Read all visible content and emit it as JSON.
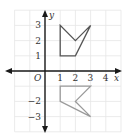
{
  "diagram": {
    "type": "coordinate-plane-reflection",
    "axes": {
      "x_label": "x",
      "y_label": "y",
      "origin_label": "O",
      "x_range": [
        -2,
        5
      ],
      "y_range": [
        -4,
        4
      ],
      "x_ticks": [
        {
          "value": 1,
          "label": "1"
        },
        {
          "value": 2,
          "label": "2"
        },
        {
          "value": 3,
          "label": "3"
        },
        {
          "value": 4,
          "label": "4"
        }
      ],
      "y_ticks": [
        {
          "value": 3,
          "label": "3"
        },
        {
          "value": 2,
          "label": "2"
        },
        {
          "value": 1,
          "label": "1"
        },
        {
          "value": -2,
          "label": "−2"
        },
        {
          "value": -3,
          "label": "−3"
        }
      ]
    },
    "shapes": [
      {
        "name": "original",
        "color": "#555555",
        "vertices": [
          [
            1,
            1
          ],
          [
            1,
            3
          ],
          [
            2,
            2
          ],
          [
            3,
            3
          ],
          [
            2,
            1
          ]
        ]
      },
      {
        "name": "reflected",
        "color": "#9a9a9a",
        "vertices": [
          [
            1,
            -1
          ],
          [
            3,
            -1
          ],
          [
            2,
            -2
          ],
          [
            3,
            -3
          ],
          [
            1,
            -2
          ]
        ]
      }
    ]
  }
}
